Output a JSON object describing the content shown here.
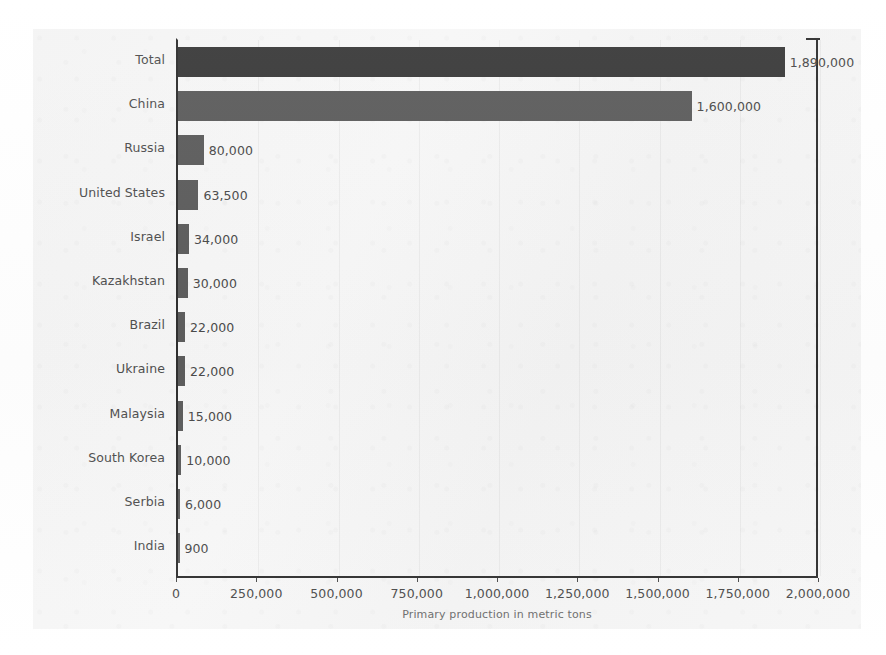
{
  "chart_data": {
    "type": "bar",
    "orientation": "horizontal",
    "title": "",
    "xlabel": "Primary production in metric tons",
    "ylabel": "",
    "xlim": [
      0,
      2000000
    ],
    "grid": true,
    "legend": "none",
    "categories": [
      "Total",
      "China",
      "Russia",
      "United States",
      "Israel",
      "Kazakhstan",
      "Brazil",
      "Ukraine",
      "Malaysia",
      "South Korea",
      "Serbia",
      "India"
    ],
    "values": [
      1890000,
      1600000,
      80000,
      63500,
      34000,
      30000,
      22000,
      22000,
      15000,
      10000,
      6000,
      900
    ],
    "value_labels": [
      "1,890,000",
      "1,600,000",
      "80,000",
      "63,500",
      "34,000",
      "30,000",
      "22,000",
      "22,000",
      "15,000",
      "10,000",
      "6,000",
      "900"
    ],
    "bar_colors": [
      "#3b3b3b",
      "#5d5d5d",
      "#5d5d5d",
      "#5d5d5d",
      "#5d5d5d",
      "#5d5d5d",
      "#5d5d5d",
      "#5d5d5d",
      "#5d5d5d",
      "#5d5d5d",
      "#5d5d5d",
      "#5d5d5d"
    ],
    "xticks": [
      0,
      250000,
      500000,
      750000,
      1000000,
      1250000,
      1500000,
      1750000,
      2000000
    ],
    "xtick_labels": [
      "0",
      "250,000",
      "500,000",
      "750,000",
      "1,000,000",
      "1,250,000",
      "1,500,000",
      "1,750,000",
      "2,000,000"
    ]
  },
  "style": {
    "paper_color": "#f5f5f5",
    "axis_color": "#2f2f2f",
    "text_color": "#4a4a4a",
    "bar_color": "#5d5d5d",
    "total_bar_color": "#3b3b3b"
  }
}
